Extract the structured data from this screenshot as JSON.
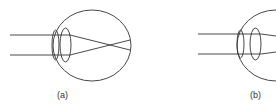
{
  "diagram": {
    "stroke_color": "#333333",
    "panels": [
      {
        "id": "a",
        "label": "(a)",
        "rays": "parallel rays converge and cross inside the eyeball before reaching the retina"
      },
      {
        "id": "b",
        "label": "(b)",
        "rays": "parallel rays pass through cornea and lens; eyeball partially cropped at right edge"
      }
    ]
  }
}
